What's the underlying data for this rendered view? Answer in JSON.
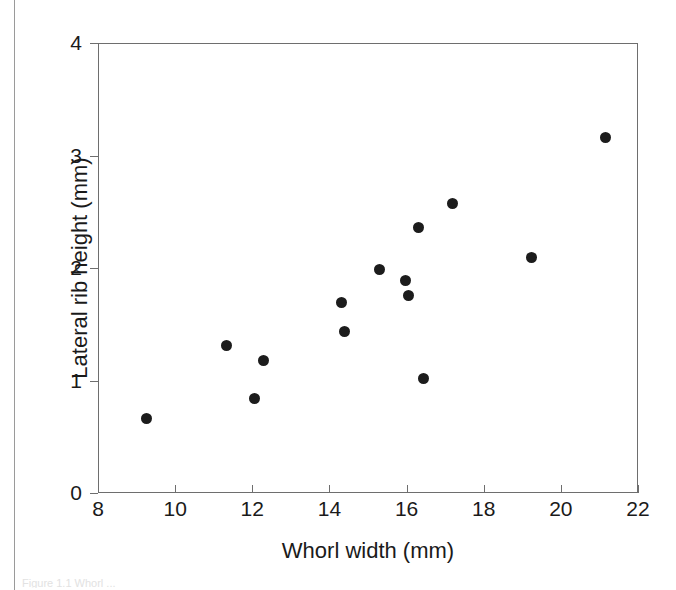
{
  "figure": {
    "caption_ghost": "Figure 1.1  Whorl ..."
  },
  "chart_data": {
    "type": "scatter",
    "title": "",
    "xlabel": "Whorl width (mm)",
    "ylabel": "Lateral rib height (mm)",
    "xlim": [
      8,
      22
    ],
    "ylim": [
      0,
      4
    ],
    "xticks": [
      8,
      10,
      12,
      14,
      16,
      18,
      20,
      22
    ],
    "yticks": [
      0,
      1,
      2,
      3,
      4
    ],
    "xtick_labels": [
      "8",
      "10",
      "12",
      "14",
      "16",
      "18",
      "20",
      "22"
    ],
    "ytick_labels": [
      "0",
      "1",
      "2",
      "3",
      "4"
    ],
    "grid": false,
    "legend": null,
    "marker": {
      "shape": "filled-circle",
      "color": "#1c1c1c",
      "size_px": 11
    },
    "axis_color": "#6e6e6e",
    "points": [
      {
        "x": 9.25,
        "y": 0.66
      },
      {
        "x": 11.34,
        "y": 1.31
      },
      {
        "x": 12.07,
        "y": 0.84
      },
      {
        "x": 12.3,
        "y": 1.18
      },
      {
        "x": 14.31,
        "y": 1.69
      },
      {
        "x": 14.39,
        "y": 1.44
      },
      {
        "x": 15.3,
        "y": 1.99
      },
      {
        "x": 15.97,
        "y": 1.89
      },
      {
        "x": 16.04,
        "y": 1.76
      },
      {
        "x": 16.3,
        "y": 2.36
      },
      {
        "x": 16.45,
        "y": 1.02
      },
      {
        "x": 17.2,
        "y": 2.57
      },
      {
        "x": 19.23,
        "y": 2.09
      },
      {
        "x": 21.15,
        "y": 3.16
      }
    ]
  }
}
